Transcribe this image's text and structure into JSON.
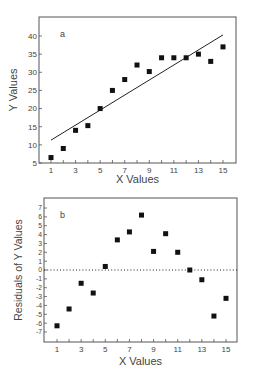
{
  "chart_data": [
    {
      "panel": "a",
      "type": "scatter",
      "title": "",
      "panel_label": "a",
      "xlabel": "X Values",
      "ylabel": "Y Values",
      "xlim": [
        0.3,
        16
      ],
      "ylim": [
        5,
        44
      ],
      "xticks": [
        1,
        3,
        5,
        7,
        9,
        11,
        13,
        15
      ],
      "yticks": [
        5,
        10,
        15,
        20,
        25,
        30,
        35,
        40
      ],
      "grid": false,
      "legend": null,
      "x": [
        1,
        2,
        3,
        4,
        5,
        6,
        7,
        8,
        9,
        10,
        11,
        12,
        13,
        14,
        15
      ],
      "series": [
        {
          "name": "Y Values",
          "marker": "square",
          "values": [
            6.5,
            9,
            14,
            15.3,
            20,
            25,
            28,
            32,
            30.2,
            34,
            34,
            34,
            35,
            33,
            37
          ]
        }
      ],
      "fit_line": {
        "x": [
          1,
          15
        ],
        "y": [
          11.3,
          40.3
        ],
        "style": "solid"
      }
    },
    {
      "panel": "b",
      "type": "scatter",
      "title": "",
      "panel_label": "b",
      "xlabel": "X Values",
      "ylabel": "Residuals of Y Values",
      "xlim": [
        0.3,
        16
      ],
      "ylim": [
        -8,
        8
      ],
      "xticks": [
        1,
        3,
        5,
        7,
        9,
        11,
        13,
        15
      ],
      "yticks": [
        7,
        6,
        5,
        4,
        3,
        2,
        1,
        0,
        -1,
        -2,
        -3,
        -4,
        -5,
        -6,
        -7
      ],
      "grid": false,
      "legend": null,
      "x": [
        1,
        2,
        3,
        4,
        5,
        6,
        7,
        8,
        9,
        10,
        11,
        12,
        13,
        14,
        15
      ],
      "series": [
        {
          "name": "Residuals",
          "marker": "square",
          "values": [
            -6.3,
            -4.4,
            -1.5,
            -2.6,
            0.4,
            3.4,
            4.3,
            6.2,
            2.1,
            4.1,
            2.0,
            0,
            -1.1,
            -5.2,
            -3.2
          ]
        }
      ],
      "reference_line": {
        "y": 0,
        "style": "dotted"
      }
    }
  ],
  "colors": {
    "frame": "#555555",
    "marker": "#111111",
    "text": "#444444",
    "line": "#222222"
  }
}
